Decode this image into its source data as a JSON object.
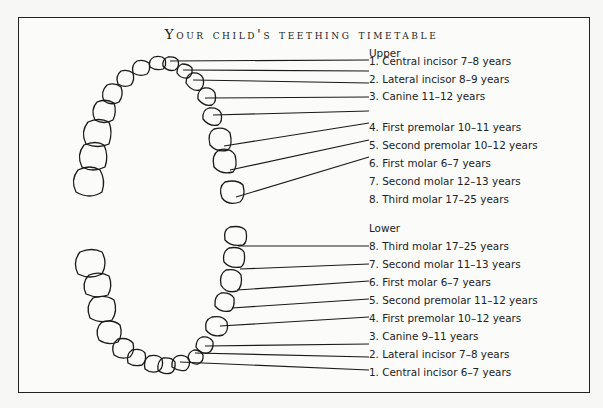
{
  "title": "Your child's teething timetable",
  "upper": {
    "heading": "Upper",
    "items": [
      {
        "label": "1. Central incisor 7–8 years"
      },
      {
        "label": "2. Lateral incisor 8–9 years"
      },
      {
        "label": "3. Canine 11–12 years"
      },
      {
        "label": "4. First premolar 10–11 years"
      },
      {
        "label": "5. Second premolar 10–12 years"
      },
      {
        "label": "6. First molar 6–7 years"
      },
      {
        "label": "7. Second molar 12–13 years"
      },
      {
        "label": "8. Third molar 17–25 years"
      }
    ]
  },
  "lower": {
    "heading": "Lower",
    "items": [
      {
        "label": "8. Third molar 17–25 years"
      },
      {
        "label": "7. Second molar 11–13 years"
      },
      {
        "label": "6. First molar 6–7 years"
      },
      {
        "label": "5. Second premolar 11–12 years"
      },
      {
        "label": "4. First premolar 10–12 years"
      },
      {
        "label": "3. Canine 9–11 years"
      },
      {
        "label": "2. Lateral incisor 7–8 years"
      },
      {
        "label": "1. Central incisor 6–7 years"
      }
    ]
  },
  "colors": {
    "ink": "#1a1a1a",
    "paper": "#fbfbfa"
  }
}
